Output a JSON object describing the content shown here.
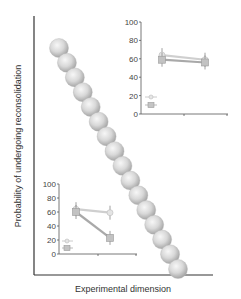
{
  "chart_data": [
    {
      "type": "scatter",
      "role": "main",
      "title": "",
      "xlabel": "Experimental dimension",
      "ylabel": "Probability of undergoing reconsolidation",
      "grid": false,
      "description": "Diagonal chain of 16 spheres descending from upper-left to lower-right",
      "spheres": [
        {
          "x": 59,
          "y": 48
        },
        {
          "x": 67,
          "y": 60
        },
        {
          "x": 75,
          "y": 71
        },
        {
          "x": 82,
          "y": 82
        },
        {
          "x": 89,
          "y": 94
        },
        {
          "x": 97,
          "y": 106
        },
        {
          "x": 105,
          "y": 118
        },
        {
          "x": 113,
          "y": 130
        },
        {
          "x": 121,
          "y": 142
        },
        {
          "x": 128,
          "y": 154
        },
        {
          "x": 136,
          "y": 166
        },
        {
          "x": 144,
          "y": 178
        },
        {
          "x": 152,
          "y": 190
        },
        {
          "x": 160,
          "y": 202
        },
        {
          "x": 168,
          "y": 214
        },
        {
          "x": 177,
          "y": 240
        }
      ]
    },
    {
      "type": "line",
      "role": "inset-top-right",
      "yticks": [
        "0",
        "20",
        "40",
        "60",
        "80",
        "100"
      ],
      "ylim": [
        0,
        100
      ],
      "x": [
        1,
        2
      ],
      "series": [
        {
          "name": "circle",
          "marker": "circle",
          "values": [
            64,
            59
          ]
        },
        {
          "name": "square",
          "marker": "square",
          "values": [
            59,
            56
          ]
        }
      ],
      "legend_position": "lower-left"
    },
    {
      "type": "line",
      "role": "inset-bottom-left",
      "yticks": [
        "0",
        "20",
        "40",
        "60",
        "80",
        "100"
      ],
      "ylim": [
        0,
        100
      ],
      "x": [
        1,
        2
      ],
      "series": [
        {
          "name": "circle",
          "marker": "circle",
          "values": [
            64,
            59
          ]
        },
        {
          "name": "square",
          "marker": "square",
          "values": [
            60,
            23
          ]
        }
      ],
      "legend_position": "lower-left"
    }
  ],
  "labels": {
    "xlabel": "Experimental dimension",
    "ylabel": "Probability of undergoing reconsolidation",
    "yticks": [
      "0",
      "20",
      "40",
      "60",
      "80",
      "100"
    ]
  },
  "colors": {
    "axis": "#333333",
    "sphere_light": "#f2f2f2",
    "sphere_dark": "#a9a9a9",
    "line_circle": "#c8c8c8",
    "line_square": "#a8a8a8"
  }
}
